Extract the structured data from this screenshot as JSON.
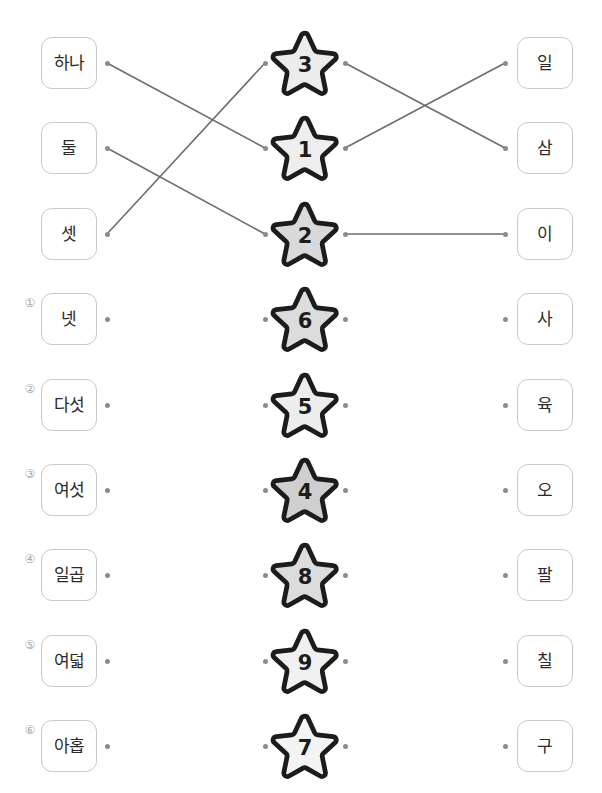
{
  "worksheet": {
    "title": "Korean number matching worksheet",
    "colors": {
      "box_border": "#c9c9c9",
      "text": "#2b2b2b",
      "line": "#6e6e6e",
      "dot": "#8b8b8b",
      "star_outline": "#1c1c1c",
      "star_fill_light": "#f0f0f0",
      "star_fill_mid": "#e0e0e0",
      "star_fill_dark": "#cccccc",
      "index_marker": "#a8a8a8"
    }
  },
  "rows": [
    {
      "index_label": "",
      "left_word": "하나",
      "star_number": "3",
      "star_fill": "#ececec",
      "right_word": "일",
      "answered": true
    },
    {
      "index_label": "",
      "left_word": "둘",
      "star_number": "1",
      "star_fill": "#eeeeee",
      "right_word": "삼",
      "answered": true
    },
    {
      "index_label": "",
      "left_word": "셋",
      "star_number": "2",
      "star_fill": "#d9d9d9",
      "right_word": "이",
      "answered": true
    },
    {
      "index_label": "①",
      "left_word": "넷",
      "star_number": "6",
      "star_fill": "#dcdcdc",
      "right_word": "사",
      "answered": false
    },
    {
      "index_label": "②",
      "left_word": "다섯",
      "star_number": "5",
      "star_fill": "#ededed",
      "right_word": "육",
      "answered": false
    },
    {
      "index_label": "③",
      "left_word": "여섯",
      "star_number": "4",
      "star_fill": "#cfcfcf",
      "right_word": "오",
      "answered": false
    },
    {
      "index_label": "④",
      "left_word": "일곱",
      "star_number": "8",
      "star_fill": "#dcdcdc",
      "right_word": "팔",
      "answered": false
    },
    {
      "index_label": "⑤",
      "left_word": "여덟",
      "star_number": "9",
      "star_fill": "#f0f0f0",
      "right_word": "칠",
      "answered": false
    },
    {
      "index_label": "⑥",
      "left_word": "아홉",
      "star_number": "7",
      "star_fill": "#f4f4f4",
      "right_word": "구",
      "answered": false
    }
  ],
  "connections": [
    {
      "from": "하나",
      "to_star": "1",
      "x1": 107,
      "y1": 63,
      "x2": 265,
      "y2": 148
    },
    {
      "from": "둘",
      "to_star": "2",
      "x1": 107,
      "y1": 148,
      "x2": 265,
      "y2": 234
    },
    {
      "from": "셋",
      "to_star": "3",
      "x1": 107,
      "y1": 234,
      "x2": 265,
      "y2": 63
    },
    {
      "from": "star3",
      "to_word": "삼",
      "x1": 345,
      "y1": 63,
      "x2": 505,
      "y2": 148
    },
    {
      "from": "star1",
      "to_word": "일",
      "x1": 345,
      "y1": 148,
      "x2": 505,
      "y2": 63
    },
    {
      "from": "star2",
      "to_word": "이",
      "x1": 345,
      "y1": 234,
      "x2": 505,
      "y2": 234
    }
  ],
  "row_y_centers": [
    63,
    148,
    234,
    319,
    405,
    490,
    575,
    661,
    746
  ]
}
